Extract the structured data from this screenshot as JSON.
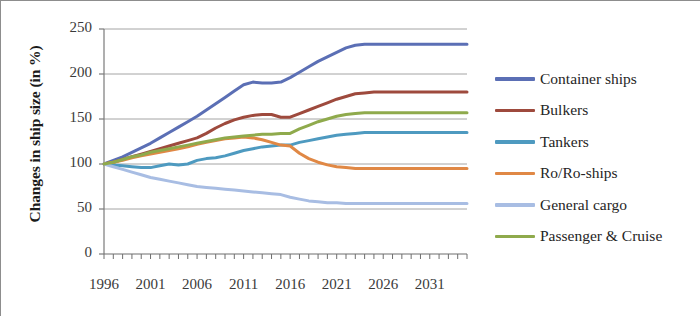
{
  "chart_data": {
    "type": "line",
    "title": "",
    "xlabel": "",
    "ylabel": "Changes in ship size (in %)",
    "xlim": [
      1996,
      2035
    ],
    "ylim": [
      0,
      250
    ],
    "yticks": [
      0,
      50,
      100,
      150,
      200,
      250
    ],
    "xticks": [
      1996,
      2001,
      2006,
      2011,
      2016,
      2021,
      2026,
      2031
    ],
    "x_minor_tick_interval": 1,
    "grid": "horizontal",
    "legend_position": "right",
    "x": [
      1996,
      1997,
      1998,
      1999,
      2000,
      2001,
      2002,
      2003,
      2004,
      2005,
      2006,
      2007,
      2008,
      2009,
      2010,
      2011,
      2012,
      2013,
      2014,
      2015,
      2016,
      2017,
      2018,
      2019,
      2020,
      2021,
      2022,
      2023,
      2024,
      2025,
      2026,
      2027,
      2028,
      2029,
      2030,
      2031,
      2032,
      2033,
      2034,
      2035
    ],
    "series": [
      {
        "name": "Container ships",
        "color": "#5b6fb5",
        "values": [
          100,
          104,
          108,
          113,
          118,
          123,
          129,
          135,
          141,
          147,
          153,
          160,
          167,
          174,
          181,
          188,
          191,
          190,
          190,
          191,
          196,
          202,
          208,
          214,
          219,
          224,
          229,
          232,
          233,
          233,
          233,
          233,
          233,
          233,
          233,
          233,
          233,
          233,
          233,
          233
        ]
      },
      {
        "name": "Bulkers",
        "color": "#9e4a3d",
        "values": [
          100,
          102,
          105,
          108,
          111,
          114,
          117,
          120,
          123,
          126,
          129,
          134,
          140,
          145,
          149,
          152,
          154,
          155,
          155,
          152,
          152,
          156,
          160,
          164,
          168,
          172,
          175,
          178,
          179,
          180,
          180,
          180,
          180,
          180,
          180,
          180,
          180,
          180,
          180,
          180
        ]
      },
      {
        "name": "Tankers",
        "color": "#4e9ac0",
        "values": [
          100,
          99,
          98,
          97,
          96,
          96,
          98,
          100,
          99,
          100,
          104,
          106,
          107,
          109,
          112,
          115,
          117,
          119,
          120,
          121,
          121,
          124,
          126,
          128,
          130,
          132,
          133,
          134,
          135,
          135,
          135,
          135,
          135,
          135,
          135,
          135,
          135,
          135,
          135,
          135
        ]
      },
      {
        "name": "Ro/Ro-ships",
        "color": "#e08845",
        "values": [
          100,
          102,
          104,
          107,
          109,
          111,
          113,
          115,
          117,
          119,
          122,
          124,
          126,
          128,
          129,
          130,
          129,
          127,
          124,
          121,
          120,
          112,
          106,
          102,
          99,
          97,
          96,
          95,
          95,
          95,
          95,
          95,
          95,
          95,
          95,
          95,
          95,
          95,
          95,
          95
        ]
      },
      {
        "name": "General cargo",
        "color": "#a8bde3",
        "values": [
          100,
          97,
          94,
          91,
          88,
          85,
          83,
          81,
          79,
          77,
          75,
          74,
          73,
          72,
          71,
          70,
          69,
          68,
          67,
          66,
          63,
          61,
          59,
          58,
          57,
          57,
          56,
          56,
          56,
          56,
          56,
          56,
          56,
          56,
          56,
          56,
          56,
          56,
          56,
          56
        ]
      },
      {
        "name": "Passenger & Cruise",
        "color": "#8faa4c",
        "values": [
          100,
          102,
          105,
          108,
          110,
          113,
          115,
          117,
          119,
          121,
          123,
          125,
          127,
          129,
          130,
          131,
          132,
          133,
          133,
          134,
          134,
          139,
          143,
          147,
          150,
          153,
          155,
          156,
          157,
          157,
          157,
          157,
          157,
          157,
          157,
          157,
          157,
          157,
          157,
          157
        ]
      }
    ]
  }
}
